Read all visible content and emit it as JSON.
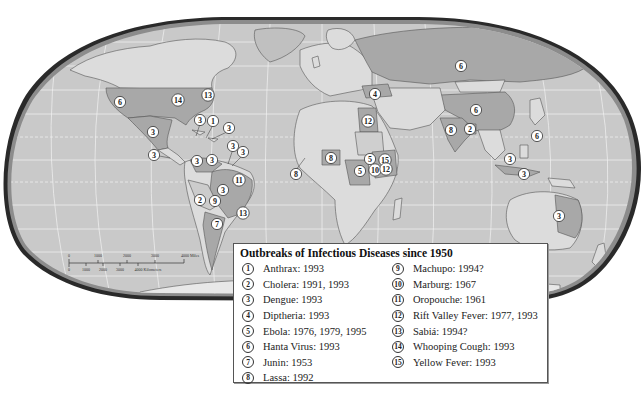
{
  "map": {
    "projection": "robinson",
    "colors": {
      "ocean": "#c9c9c9",
      "land": "#dcdcdc",
      "outbreak_country": "#a8a8a8",
      "border": "#555555",
      "frame": "#2a2a2a",
      "frame_inner": "#8c8c8c",
      "gridline": "#f2f2f2"
    },
    "markers": [
      {
        "id": "6",
        "x": 120,
        "y": 102
      },
      {
        "id": "14",
        "x": 178,
        "y": 100
      },
      {
        "id": "13",
        "x": 208,
        "y": 95
      },
      {
        "id": "3",
        "x": 200,
        "y": 120
      },
      {
        "id": "1",
        "x": 213,
        "y": 121
      },
      {
        "id": "3",
        "x": 229,
        "y": 128
      },
      {
        "id": "3",
        "x": 153,
        "y": 132
      },
      {
        "id": "3",
        "x": 154,
        "y": 155
      },
      {
        "id": "3",
        "x": 197,
        "y": 161
      },
      {
        "id": "3",
        "x": 212,
        "y": 160
      },
      {
        "id": "3",
        "x": 233,
        "y": 146
      },
      {
        "id": "3",
        "x": 243,
        "y": 152
      },
      {
        "id": "11",
        "x": 239,
        "y": 180
      },
      {
        "id": "3",
        "x": 223,
        "y": 190
      },
      {
        "id": "2",
        "x": 200,
        "y": 200
      },
      {
        "id": "9",
        "x": 215,
        "y": 201
      },
      {
        "id": "13",
        "x": 243,
        "y": 213
      },
      {
        "id": "7",
        "x": 217,
        "y": 224
      },
      {
        "id": "4",
        "x": 375,
        "y": 94
      },
      {
        "id": "12",
        "x": 368,
        "y": 121
      },
      {
        "id": "8",
        "x": 331,
        "y": 158
      },
      {
        "id": "8",
        "x": 296,
        "y": 174
      },
      {
        "id": "5",
        "x": 370,
        "y": 159
      },
      {
        "id": "15",
        "x": 385,
        "y": 160
      },
      {
        "id": "5",
        "x": 360,
        "y": 171
      },
      {
        "id": "10",
        "x": 375,
        "y": 170
      },
      {
        "id": "12",
        "x": 386,
        "y": 169
      },
      {
        "id": "6",
        "x": 461,
        "y": 66
      },
      {
        "id": "6",
        "x": 476,
        "y": 110
      },
      {
        "id": "8",
        "x": 451,
        "y": 130
      },
      {
        "id": "2",
        "x": 470,
        "y": 129
      },
      {
        "id": "6",
        "x": 537,
        "y": 136
      },
      {
        "id": "3",
        "x": 510,
        "y": 159
      },
      {
        "id": "3",
        "x": 524,
        "y": 174
      },
      {
        "id": "3",
        "x": 559,
        "y": 216
      }
    ],
    "scale_bar": {
      "miles_ticks": [
        "0",
        "1000",
        "2000",
        "3000",
        "4000 Miles"
      ],
      "km_ticks": [
        "0",
        "1000",
        "2000",
        "3000",
        "4000 Kilometers"
      ]
    }
  },
  "legend": {
    "title": "Outbreaks of Infectious Diseases since 1950",
    "items": [
      {
        "num": "1",
        "label": "Anthrax:  1993"
      },
      {
        "num": "2",
        "label": "Cholera:  1991, 1993"
      },
      {
        "num": "3",
        "label": "Dengue:  1993"
      },
      {
        "num": "4",
        "label": "Diptheria: 1993"
      },
      {
        "num": "5",
        "label": "Ebola: 1976, 1979, 1995"
      },
      {
        "num": "6",
        "label": "Hanta Virus: 1993"
      },
      {
        "num": "7",
        "label": "Junin: 1953"
      },
      {
        "num": "8",
        "label": "Lassa: 1992"
      },
      {
        "num": "9",
        "label": "Machupo:  1994?"
      },
      {
        "num": "10",
        "label": "Marburg:  1967"
      },
      {
        "num": "11",
        "label": "Oropouche:  1961"
      },
      {
        "num": "12",
        "label": "Rift Valley Fever: 1977, 1993"
      },
      {
        "num": "13",
        "label": "Sabiá: 1994?"
      },
      {
        "num": "14",
        "label": "Whooping Cough: 1993"
      },
      {
        "num": "15",
        "label": "Yellow Fever: 1993"
      }
    ]
  }
}
